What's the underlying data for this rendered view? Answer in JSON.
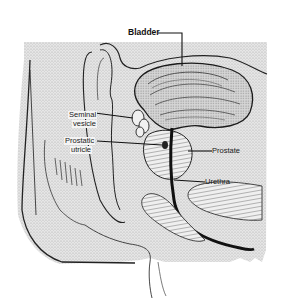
{
  "diagram": {
    "labels": {
      "bladder": "Bladder",
      "seminal_vesicle_line1": "Seminal",
      "seminal_vesicle_line2": "vesicle",
      "prostatic_utricle_line1": "Prostatic",
      "prostatic_utricle_line2": "utricle",
      "prostate": "Prostate",
      "urethra": "Urethra"
    },
    "colors": {
      "background": "#ffffff",
      "stipple": "#d9d9d9",
      "ink": "#1a1a1a"
    }
  }
}
